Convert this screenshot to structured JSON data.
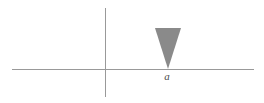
{
  "figure": {
    "width": 264,
    "height": 103,
    "background_color": "#ffffff"
  },
  "axes": {
    "color": "#999999",
    "stroke_width": 1,
    "horizontal": {
      "name": "x-axis",
      "x1": 12,
      "y1": 69,
      "x2": 254,
      "y2": 69
    },
    "vertical": {
      "name": "y-axis",
      "x1": 105,
      "y1": 8,
      "x2": 105,
      "y2": 97
    },
    "origin": {
      "x": 105,
      "y": 69
    }
  },
  "shapes": [
    {
      "name": "shaded-triangle",
      "type": "triangle",
      "fill_color": "#8a8a8a",
      "points": "155,28 181,28 168,69",
      "vertices": [
        {
          "x": 155,
          "y": 28
        },
        {
          "x": 181,
          "y": 28
        },
        {
          "x": 168,
          "y": 69
        }
      ]
    }
  ],
  "labels": [
    {
      "name": "point-label-a",
      "text": "a",
      "x": 167,
      "y": 80,
      "style": "italic",
      "color": "#4d4d4d"
    }
  ]
}
